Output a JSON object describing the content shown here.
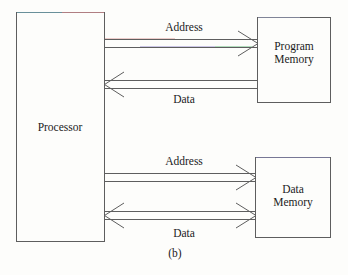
{
  "figure": {
    "caption": "(b)",
    "background_color": "#fdfdfb",
    "line_color": "#5a5a5a",
    "text_color": "#1b1b1b"
  },
  "blocks": [
    {
      "id": "processor",
      "label": "Processor",
      "label_lines": [
        "Processor"
      ],
      "x": 16,
      "y": 12,
      "width": 88,
      "height": 229
    },
    {
      "id": "program-memory",
      "label": "Program Memory",
      "label_lines": [
        "Program",
        "Memory"
      ],
      "x": 257,
      "y": 17,
      "width": 73,
      "height": 85
    },
    {
      "id": "data-memory",
      "label": "Data Memory",
      "label_lines": [
        "Data",
        "Memory"
      ],
      "x": 255,
      "y": 157,
      "width": 75,
      "height": 80
    }
  ],
  "buses": [
    {
      "id": "program-address-bus",
      "label": "Address",
      "from": "processor",
      "to": "program-memory",
      "direction": "right",
      "label_x": 184,
      "label_y": 27
    },
    {
      "id": "program-data-bus",
      "label": "Data",
      "from": "program-memory",
      "to": "processor",
      "direction": "left",
      "label_x": 184,
      "label_y": 99
    },
    {
      "id": "data-address-bus",
      "label": "Address",
      "from": "processor",
      "to": "data-memory",
      "direction": "right",
      "label_x": 184,
      "label_y": 161
    },
    {
      "id": "data-data-bus",
      "label": "Data",
      "from": "processor",
      "to": "data-memory",
      "direction": "both",
      "label_x": 184,
      "label_y": 233
    }
  ]
}
